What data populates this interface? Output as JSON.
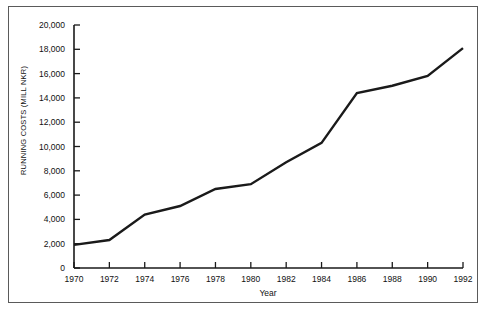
{
  "chart_data": {
    "type": "line",
    "title": "",
    "xlabel": "Year",
    "ylabel": "RUNNING COSTS (MILL NKR)",
    "x": [
      1970,
      1972,
      1974,
      1976,
      1978,
      1980,
      1982,
      1984,
      1986,
      1988,
      1990,
      1992
    ],
    "values": [
      1900,
      2300,
      4400,
      5100,
      6500,
      6900,
      8700,
      10300,
      14400,
      15000,
      15800,
      18100
    ],
    "xlim": [
      1970,
      1992
    ],
    "ylim": [
      0,
      20000
    ],
    "xticks": [
      "1970",
      "1972",
      "1974",
      "1976",
      "1978",
      "1980",
      "1982",
      "1984",
      "1986",
      "1988",
      "1990",
      "1992"
    ],
    "yticks": [
      "0",
      "2,000",
      "4,000",
      "6,000",
      "8,000",
      "10,000",
      "12,000",
      "14,000",
      "16,000",
      "18,000",
      "20,000"
    ],
    "grid": false,
    "legend": "none",
    "series": [
      {
        "name": "Running costs",
        "color": "#1a1a1a",
        "values": [
          1900,
          2300,
          4400,
          5100,
          6500,
          6900,
          8700,
          10300,
          14400,
          15000,
          15800,
          18100
        ]
      }
    ]
  },
  "style": {
    "line_color": "#1a1a1a",
    "axis_color": "#1a1a1a",
    "frame_color": "#5a5a5a",
    "background": "#ffffff"
  }
}
